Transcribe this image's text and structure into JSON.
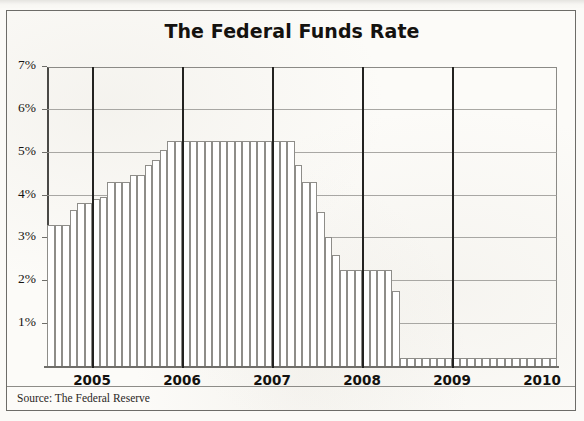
{
  "figure": {
    "title": "The Federal Funds Rate",
    "source_note": "Source: The Federal Reserve"
  },
  "chart_data": {
    "type": "bar",
    "title": "The Federal Funds Rate",
    "xlabel": "",
    "ylabel": "",
    "ylim": [
      0,
      7
    ],
    "ytick_labels": [
      "1%",
      "2%",
      "3%",
      "4%",
      "5%",
      "6%",
      "7%"
    ],
    "ytick_values": [
      1,
      2,
      3,
      4,
      5,
      6,
      7
    ],
    "grid": true,
    "legend": false,
    "xtick_labels": [
      "2005",
      "2006",
      "2007",
      "2008",
      "2009",
      "2010"
    ],
    "xtick_values": [
      2005,
      2006,
      2007,
      2008,
      2009,
      2010
    ],
    "bar_style": "hollow-outline",
    "source": "Source: The Federal Reserve",
    "x": [
      "2005-01",
      "2005-02",
      "2005-03",
      "2005-04",
      "2005-05",
      "2005-06",
      "2005-07",
      "2005-08",
      "2005-09",
      "2005-10",
      "2005-11",
      "2005-12",
      "2006-01",
      "2006-02",
      "2006-03",
      "2006-04",
      "2006-05",
      "2006-06",
      "2006-07",
      "2006-08",
      "2006-09",
      "2006-10",
      "2006-11",
      "2006-12",
      "2007-01",
      "2007-02",
      "2007-03",
      "2007-04",
      "2007-05",
      "2007-06",
      "2007-07",
      "2007-08",
      "2007-09",
      "2007-10",
      "2007-11",
      "2007-12",
      "2008-01",
      "2008-02",
      "2008-03",
      "2008-04",
      "2008-05",
      "2008-06",
      "2008-07",
      "2008-08",
      "2008-09",
      "2008-10",
      "2008-11",
      "2008-12",
      "2009-01",
      "2009-02",
      "2009-03",
      "2009-04",
      "2009-05",
      "2009-06",
      "2009-07",
      "2009-08",
      "2009-09",
      "2009-10",
      "2009-11",
      "2009-12",
      "2010-01",
      "2010-02",
      "2010-03",
      "2010-04",
      "2010-05",
      "2010-06",
      "2010-07",
      "2010-08"
    ],
    "values": [
      3.3,
      3.3,
      3.3,
      3.65,
      3.8,
      3.8,
      3.9,
      3.95,
      4.3,
      4.3,
      4.3,
      4.45,
      4.45,
      4.7,
      4.8,
      5.05,
      5.25,
      5.25,
      5.25,
      5.25,
      5.25,
      5.25,
      5.25,
      5.25,
      5.25,
      5.25,
      5.25,
      5.25,
      5.25,
      5.25,
      5.25,
      5.25,
      5.25,
      4.7,
      4.3,
      4.3,
      3.6,
      3.0,
      2.6,
      2.25,
      2.25,
      2.25,
      2.25,
      2.25,
      2.25,
      2.25,
      1.75,
      0.18,
      0.18,
      0.18,
      0.18,
      0.18,
      0.18,
      0.18,
      0.18,
      0.18,
      0.18,
      0.18,
      0.18,
      0.18,
      0.18,
      0.18,
      0.18,
      0.18,
      0.18,
      0.18,
      0.18,
      0.18
    ],
    "series": [
      {
        "name": "Federal Funds Rate",
        "unit": "percent",
        "values": [
          3.3,
          3.3,
          3.3,
          3.65,
          3.8,
          3.8,
          3.9,
          3.95,
          4.3,
          4.3,
          4.3,
          4.45,
          4.45,
          4.7,
          4.8,
          5.05,
          5.25,
          5.25,
          5.25,
          5.25,
          5.25,
          5.25,
          5.25,
          5.25,
          5.25,
          5.25,
          5.25,
          5.25,
          5.25,
          5.25,
          5.25,
          5.25,
          5.25,
          4.7,
          4.3,
          4.3,
          3.6,
          3.0,
          2.6,
          2.25,
          2.25,
          2.25,
          2.25,
          2.25,
          2.25,
          2.25,
          1.75,
          0.18,
          0.18,
          0.18,
          0.18,
          0.18,
          0.18,
          0.18,
          0.18,
          0.18,
          0.18,
          0.18,
          0.18,
          0.18,
          0.18,
          0.18,
          0.18,
          0.18,
          0.18,
          0.18,
          0.18,
          0.18
        ]
      }
    ],
    "year_dividers": [
      2005.5,
      2006.5,
      2007.5,
      2008.5,
      2009.5
    ]
  }
}
